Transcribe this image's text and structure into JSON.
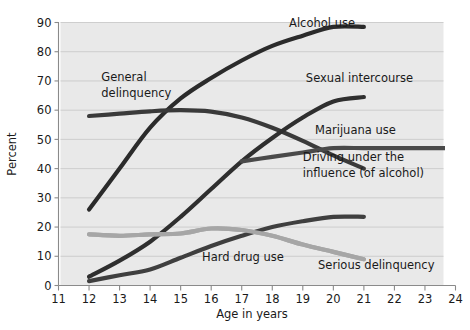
{
  "chart_data": {
    "type": "line",
    "title": "",
    "xlabel": "Age in years",
    "ylabel": "Percent",
    "xlim": [
      11,
      24
    ],
    "ylim": [
      0,
      90
    ],
    "grid": true,
    "legend_position": "inline-annotations",
    "xticks": [
      "11",
      "12",
      "13",
      "14",
      "15",
      "16",
      "17",
      "18",
      "19",
      "20",
      "21",
      "22",
      "23",
      "24"
    ],
    "yticks": [
      "0",
      "10",
      "20",
      "30",
      "40",
      "50",
      "60",
      "70",
      "80",
      "90"
    ],
    "plot_background": "#e9e9e9",
    "series": [
      {
        "name": "Alcohol use",
        "color": "#2b2b2b",
        "width": 4.2,
        "label_x": 18.6,
        "label_y": 88.0,
        "x": [
          12,
          13,
          14,
          15,
          16,
          17,
          18,
          19,
          20,
          21
        ],
        "values": [
          26,
          40,
          54,
          64,
          71,
          77,
          82,
          85.5,
          88.5,
          88.5
        ]
      },
      {
        "name": "General delinquency",
        "color": "#3a3a3a",
        "width": 4.2,
        "label_x": 12.45,
        "label_y": 69.5,
        "x": [
          12,
          13,
          14,
          15,
          16,
          17,
          18,
          19,
          20,
          21
        ],
        "values": [
          58,
          58.8,
          59.6,
          60,
          59.5,
          57.5,
          54,
          49.5,
          44.5,
          40
        ]
      },
      {
        "name": "Sexual intercourse",
        "color": "#2f2f2f",
        "width": 4.2,
        "label_x": 19.3,
        "label_y": 68.5,
        "x": [
          12,
          13,
          14,
          15,
          16,
          17,
          18,
          19,
          20,
          21
        ],
        "values": [
          3,
          8.5,
          15,
          23.5,
          33,
          42.5,
          50.5,
          57.5,
          63,
          64.5
        ]
      },
      {
        "name": "Marijuana use",
        "color": "#a6a6a6",
        "width": 4.2,
        "label_x": 19.4,
        "label_y": 52.5,
        "x": [
          12,
          13,
          14,
          15,
          16,
          17,
          18,
          19,
          20,
          21
        ],
        "values": [
          17.5,
          17,
          17.5,
          17.8,
          19.5,
          19,
          17,
          14,
          11.5,
          9
        ]
      },
      {
        "name": "Driving under the influence (of alcohol)",
        "color": "#4a4a4a",
        "width": 4.2,
        "label_x": 19.1,
        "label_y": 42.0,
        "label_line2_y": 37.5,
        "x": [
          17,
          18,
          19,
          20,
          21,
          22,
          23,
          24
        ],
        "values": [
          42.5,
          44,
          45.5,
          47,
          47,
          47,
          47,
          47
        ]
      },
      {
        "name": "Hard drug use",
        "color": "#3f3f3f",
        "width": 4.2,
        "label_x": 16.0,
        "label_y": 9.0,
        "x": [
          12,
          13,
          14,
          15,
          16,
          17,
          18,
          19,
          20,
          21
        ],
        "values": [
          1.5,
          3.5,
          5.5,
          9.5,
          13.5,
          17,
          20,
          22,
          23.5,
          23.5
        ]
      },
      {
        "name": "Serious delinquency",
        "color": "#a6a6a6",
        "width": 4.2,
        "label_x": 19.6,
        "label_y": 6.0,
        "x": [
          12,
          13,
          14,
          15,
          16,
          17,
          18,
          19,
          20,
          21
        ],
        "values": [
          17.5,
          17,
          17.5,
          17.8,
          19.5,
          19,
          17,
          14,
          11.5,
          9
        ]
      }
    ],
    "annotations": [
      {
        "text": "Alcohol use",
        "x": 18.55,
        "y": 88.5
      },
      {
        "text": "General",
        "x": 12.4,
        "y": 70.0
      },
      {
        "text": "delinquency",
        "x": 12.4,
        "y": 64.5
      },
      {
        "text": "Sexual intercourse",
        "x": 19.1,
        "y": 69.5
      },
      {
        "text": "Marijuana use",
        "x": 19.4,
        "y": 52.0
      },
      {
        "text": "Driving under the",
        "x": 19.0,
        "y": 42.5
      },
      {
        "text": "influence (of alcohol)",
        "x": 19.0,
        "y": 37.0
      },
      {
        "text": "Hard drug use",
        "x": 15.7,
        "y": 8.5
      },
      {
        "text": "Serious delinquency",
        "x": 19.5,
        "y": 5.5
      }
    ]
  }
}
